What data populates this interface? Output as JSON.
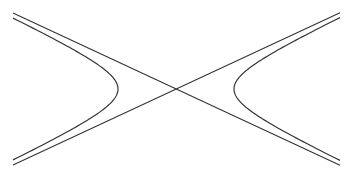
{
  "diagram": {
    "type": "hyperbola-with-asymptotes",
    "center": [
      176,
      89
    ],
    "semi_axis_a": 58,
    "semi_axis_b": 27,
    "x_extent": [
      13,
      340
    ],
    "stroke_color": "#333333",
    "asymptote_stroke_width": 1.1,
    "curve_stroke_width": 1.2,
    "elements": [
      {
        "name": "asymptote-positive-slope",
        "kind": "line"
      },
      {
        "name": "asymptote-negative-slope",
        "kind": "line"
      },
      {
        "name": "hyperbola-left-branch",
        "kind": "curve"
      },
      {
        "name": "hyperbola-right-branch",
        "kind": "curve"
      }
    ]
  }
}
